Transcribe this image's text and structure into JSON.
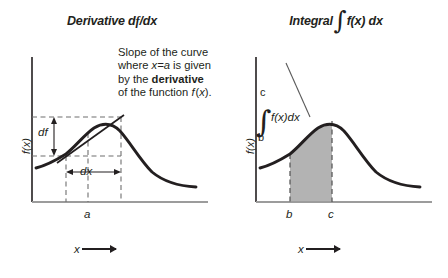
{
  "figure": {
    "panels": [
      {
        "id": "derivative",
        "title_prefix": "Derivative d",
        "title_italic_f": "f",
        "title_suffix": "/dx",
        "description_html": "Slope of the curve where <i>x=a</i> is given by the <b>derivative</b> of the function <i>f</i>&#8202;(<i>x</i>).",
        "ylabel": "f(x)",
        "xlabel": "x",
        "tick_label": "a",
        "annotations": {
          "df": "df",
          "dx": "dx"
        }
      },
      {
        "id": "integral",
        "title_prefix": "Integral",
        "title_integral_sign": "∫",
        "title_suffix": "f(x) dx",
        "description_html": "Area under the curve between <i>x=b</i> and <i>x=c</i> is given by the <b>integral</b> of the function <i>f</i>&#8202;(<i>x</i>).",
        "ylabel": "f(x)",
        "xlabel": "x",
        "tick_labels": [
          "b",
          "c"
        ],
        "integral_notation": {
          "upper_limit": "c",
          "lower_limit": "b",
          "integrand": "f(x)dx",
          "sign": "∫"
        }
      }
    ]
  },
  "chart_data": [
    {
      "type": "line",
      "id": "derivative-plot",
      "title": "Derivative df/dx",
      "xlabel": "x",
      "ylabel": "f(x)",
      "grid": false,
      "legend": null,
      "xlim": [
        0,
        10
      ],
      "ylim": [
        0,
        10
      ],
      "series": [
        {
          "name": "f(x)",
          "comment": "bell-like curve rising to a peak then falling",
          "x": [
            0.0,
            1.0,
            2.0,
            2.6,
            3.2,
            3.8,
            4.4,
            5.0,
            5.6,
            6.2,
            6.8,
            7.6,
            8.6,
            10.0
          ],
          "y": [
            3.1,
            3.3,
            3.8,
            4.3,
            5.1,
            6.1,
            6.9,
            7.3,
            7.2,
            6.6,
            5.7,
            4.4,
            3.4,
            3.0
          ]
        },
        {
          "name": "tangent-secant",
          "comment": "straight chord from (x=a-dx/2 low point) up to upper-right dashed corner",
          "x": [
            2.3,
            5.3
          ],
          "y": [
            4.05,
            7.7
          ]
        }
      ],
      "markers": {
        "a": 4.0,
        "dx_start": 2.6,
        "dx_end": 5.3,
        "df_low": 4.05,
        "df_high": 7.7
      },
      "annotations": [
        "df",
        "dx",
        "a"
      ]
    },
    {
      "type": "area",
      "id": "integral-plot",
      "title": "Integral ∫ f(x) dx",
      "xlabel": "x",
      "ylabel": "f(x)",
      "grid": false,
      "legend": null,
      "xlim": [
        0,
        10
      ],
      "ylim": [
        0,
        10
      ],
      "series": [
        {
          "name": "f(x)",
          "x": [
            0.0,
            1.0,
            2.0,
            2.6,
            3.2,
            3.8,
            4.4,
            5.0,
            5.6,
            6.2,
            6.8,
            7.6,
            8.6,
            10.0
          ],
          "y": [
            3.1,
            3.3,
            3.8,
            4.3,
            5.1,
            6.1,
            6.9,
            7.3,
            7.2,
            6.6,
            5.7,
            4.4,
            3.4,
            3.0
          ]
        }
      ],
      "shaded_region": {
        "from": 2.6,
        "to": 4.6,
        "label": "area under curve between x=b and x=c",
        "color": "#b3b3b3"
      },
      "markers": {
        "b": 2.6,
        "c": 4.6
      },
      "annotations": [
        "b",
        "c"
      ]
    }
  ],
  "colors": {
    "ink": "#231f20",
    "axis_gray": "#9c9c9c",
    "dash_gray": "#7a7a7a",
    "shade_gray": "#b3b3b3",
    "background": "#ffffff"
  }
}
